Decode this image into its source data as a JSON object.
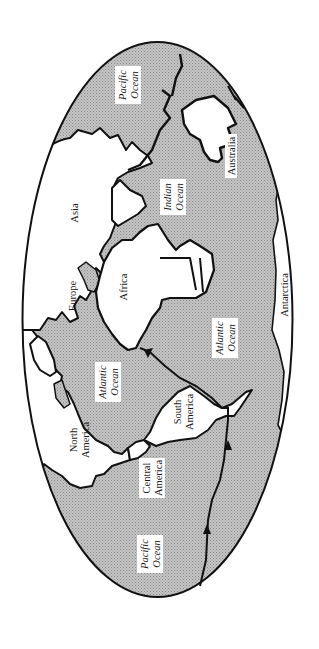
{
  "map": {
    "projection": "elliptical world map, rotated 90° (north to the left)",
    "colors": {
      "ocean": "#b9b9b9",
      "land": "#ffffff",
      "outline": "#111111",
      "label_bg": "#ffffff",
      "background": "#ffffff"
    },
    "labels": {
      "pacific_ocean_top": [
        "Pacific",
        "Ocean"
      ],
      "indian_ocean": [
        "Indian",
        "Ocean"
      ],
      "australia": "Australia",
      "asia": "Asia",
      "europe": "Europe",
      "africa": "Africa",
      "antarctica": "Antarctica",
      "atlantic_ocean_north": [
        "Atlantic",
        "Ocean"
      ],
      "atlantic_ocean_south": [
        "Atlantic",
        "Ocean"
      ],
      "north_america": [
        "North",
        "America"
      ],
      "south_america": [
        "South",
        "America"
      ],
      "central_america": [
        "Central",
        "America"
      ],
      "pacific_ocean_bottom": [
        "Pacific",
        "Ocean"
      ]
    },
    "route": {
      "description": "voyage route from Pacific Ocean around South America to Atlantic, ending at Africa",
      "arrow_count": 3
    }
  }
}
